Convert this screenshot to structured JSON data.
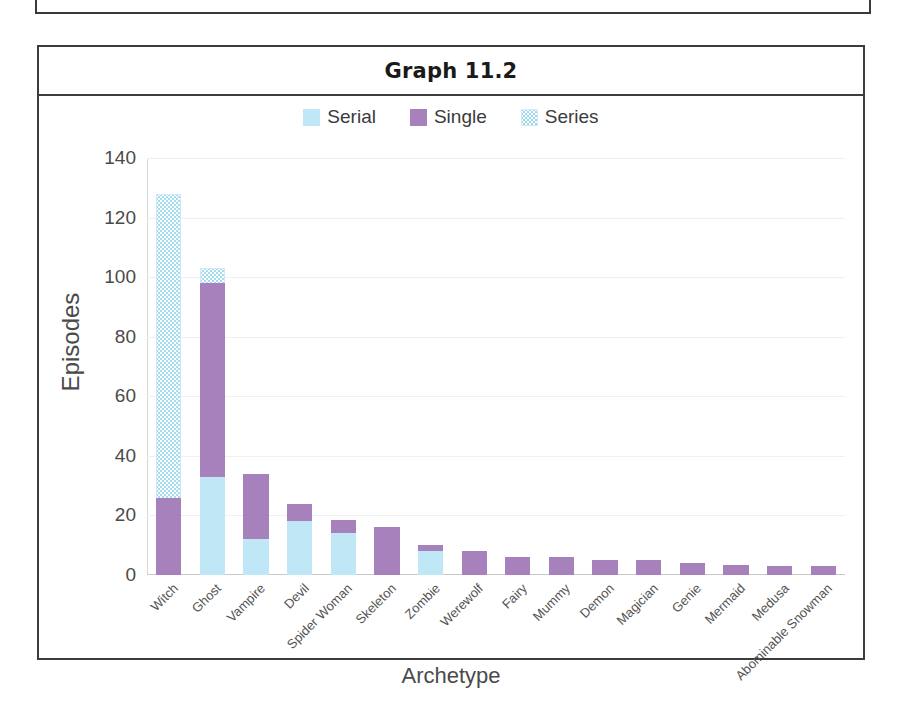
{
  "chart_title": "Graph 11.2",
  "legend": {
    "position": "top-center",
    "items": [
      {
        "label": "Serial",
        "key": "serial",
        "color": "#bfe7f5",
        "pattern": "solid"
      },
      {
        "label": "Single",
        "key": "single",
        "color": "#a681bb",
        "pattern": "solid"
      },
      {
        "label": "Series",
        "key": "series",
        "color": "#bfe7f5",
        "pattern": "dotted"
      }
    ]
  },
  "chart_data": {
    "type": "bar",
    "subtype": "stacked",
    "title": "Graph 11.2",
    "xlabel": "Archetype",
    "ylabel": "Episodes",
    "ylim": [
      0,
      140
    ],
    "yticks": [
      0,
      20,
      40,
      60,
      80,
      100,
      120,
      140
    ],
    "grid": true,
    "categories": [
      "Witch",
      "Ghost",
      "Vampire",
      "Devil",
      "Spider Woman",
      "Skeleton",
      "Zombie",
      "Werewolf",
      "Fairy",
      "Mummy",
      "Demon",
      "Magician",
      "Genie",
      "Mermaid",
      "Medusa",
      "Abominable Snowman"
    ],
    "series": [
      {
        "name": "Serial",
        "color": "#bfe7f5",
        "values": [
          0,
          33,
          12,
          18,
          14,
          0,
          8,
          0,
          0,
          0,
          0,
          0,
          0,
          0,
          0,
          0
        ]
      },
      {
        "name": "Single",
        "color": "#a681bb",
        "values": [
          26,
          65,
          22,
          6,
          4.5,
          16,
          2,
          8,
          6,
          6,
          5,
          5,
          4,
          3.5,
          3,
          3
        ]
      },
      {
        "name": "Series",
        "color": "#bfe7f5",
        "values": [
          102,
          5,
          0,
          0,
          0,
          0,
          0,
          0,
          0,
          0,
          0,
          0,
          0,
          0,
          0,
          0
        ]
      }
    ],
    "totals": [
      128,
      103,
      34,
      24,
      18.5,
      16,
      10,
      8,
      6,
      6,
      5,
      5,
      4,
      3.5,
      3,
      3
    ]
  }
}
